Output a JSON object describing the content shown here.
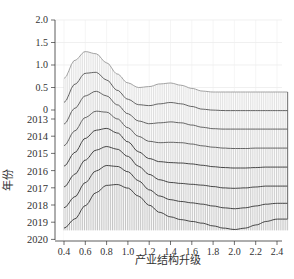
{
  "chart_data": {
    "type": "area",
    "subtype": "3d-ridgeline-density",
    "title": "",
    "xlabel": "产业结构升级",
    "ylabel": "年份",
    "zlabel": "",
    "x_ticks": [
      "0.4",
      "0.6",
      "0.8",
      "1.0",
      "1.2",
      "1.4",
      "1.6",
      "1.8",
      "2.0",
      "2.2",
      "2.4"
    ],
    "z_ticks": [
      "0",
      "0.5",
      "1.0",
      "1.5",
      "2.0"
    ],
    "year_ticks": [
      "2013",
      "2014",
      "2015",
      "2016",
      "2017",
      "2018",
      "2019",
      "2020"
    ],
    "xlim": [
      0.35,
      2.5
    ],
    "zlim": [
      0,
      2.0
    ],
    "grid": true,
    "legend": null,
    "x": [
      0.4,
      0.5,
      0.6,
      0.7,
      0.8,
      0.9,
      1.0,
      1.1,
      1.2,
      1.3,
      1.4,
      1.5,
      1.6,
      1.7,
      1.8,
      1.9,
      2.0,
      2.1,
      2.2,
      2.3,
      2.4,
      2.5
    ],
    "series": [
      {
        "name": "2013",
        "values": [
          0.7,
          1.1,
          1.3,
          1.25,
          1.05,
          0.8,
          0.6,
          0.5,
          0.52,
          0.58,
          0.6,
          0.55,
          0.48,
          0.42,
          0.4,
          0.4,
          0.4,
          0.4,
          0.4,
          0.4,
          0.4,
          0.4
        ]
      },
      {
        "name": "2014",
        "values": [
          0.55,
          0.95,
          1.2,
          1.22,
          1.05,
          0.82,
          0.62,
          0.5,
          0.48,
          0.52,
          0.55,
          0.52,
          0.46,
          0.4,
          0.38,
          0.37,
          0.37,
          0.37,
          0.37,
          0.37,
          0.37,
          0.37
        ]
      },
      {
        "name": "2015",
        "values": [
          0.45,
          0.8,
          1.08,
          1.18,
          1.08,
          0.88,
          0.68,
          0.52,
          0.46,
          0.48,
          0.5,
          0.48,
          0.43,
          0.38,
          0.35,
          0.34,
          0.34,
          0.34,
          0.34,
          0.34,
          0.34,
          0.34
        ]
      },
      {
        "name": "2016",
        "values": [
          0.35,
          0.68,
          0.98,
          1.12,
          1.1,
          0.95,
          0.75,
          0.56,
          0.45,
          0.42,
          0.43,
          0.42,
          0.39,
          0.35,
          0.32,
          0.3,
          0.29,
          0.29,
          0.3,
          0.3,
          0.3,
          0.3
        ]
      },
      {
        "name": "2017",
        "values": [
          0.28,
          0.58,
          0.9,
          1.08,
          1.12,
          1.02,
          0.82,
          0.6,
          0.45,
          0.38,
          0.36,
          0.35,
          0.33,
          0.3,
          0.27,
          0.25,
          0.24,
          0.24,
          0.25,
          0.26,
          0.26,
          0.26
        ]
      },
      {
        "name": "2018",
        "values": [
          0.2,
          0.48,
          0.8,
          1.02,
          1.1,
          1.04,
          0.88,
          0.66,
          0.48,
          0.36,
          0.3,
          0.28,
          0.26,
          0.24,
          0.21,
          0.18,
          0.17,
          0.18,
          0.2,
          0.22,
          0.22,
          0.22
        ]
      },
      {
        "name": "2019",
        "values": [
          0.12,
          0.36,
          0.68,
          0.94,
          1.06,
          1.04,
          0.92,
          0.72,
          0.52,
          0.38,
          0.3,
          0.26,
          0.23,
          0.2,
          0.16,
          0.12,
          0.1,
          0.12,
          0.16,
          0.2,
          0.22,
          0.22
        ]
      },
      {
        "name": "2020",
        "values": [
          0.05,
          0.25,
          0.55,
          0.84,
          1.0,
          1.02,
          0.94,
          0.76,
          0.56,
          0.4,
          0.3,
          0.24,
          0.2,
          0.16,
          0.1,
          0.05,
          0.02,
          0.05,
          0.12,
          0.2,
          0.25,
          0.25
        ]
      }
    ]
  },
  "caption_partial": ""
}
